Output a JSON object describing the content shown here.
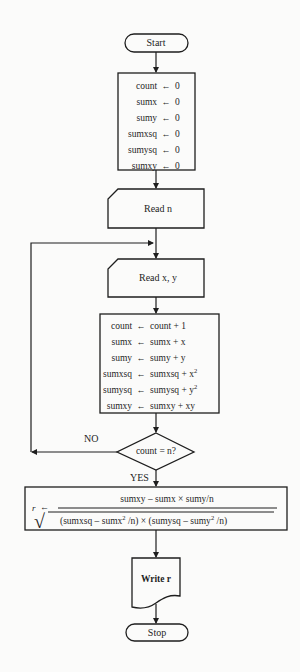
{
  "diagram": {
    "type": "flowchart",
    "nodes": {
      "start": {
        "shape": "terminal",
        "label": "Start"
      },
      "init": {
        "shape": "process",
        "rows": [
          {
            "lhs": "count",
            "op": "←",
            "rhs": "0"
          },
          {
            "lhs": "sumx",
            "op": "←",
            "rhs": "0"
          },
          {
            "lhs": "sumy",
            "op": "←",
            "rhs": "0"
          },
          {
            "lhs": "sumxsq",
            "op": "←",
            "rhs": "0"
          },
          {
            "lhs": "sumysq",
            "op": "←",
            "rhs": "0"
          },
          {
            "lhs": "sumxy",
            "op": "←",
            "rhs": "0"
          }
        ]
      },
      "read_n": {
        "shape": "input-card",
        "label": "Read  n"
      },
      "read_xy": {
        "shape": "input-card",
        "label": "Read  x, y"
      },
      "accumulate": {
        "shape": "process",
        "rows": [
          {
            "lhs": "count",
            "op": "←",
            "rhs": "count + 1",
            "sup": ""
          },
          {
            "lhs": "sumx",
            "op": "←",
            "rhs": "sumx + x",
            "sup": ""
          },
          {
            "lhs": "sumy",
            "op": "←",
            "rhs": "sumy + y",
            "sup": ""
          },
          {
            "lhs": "sumxsq",
            "op": "←",
            "rhs": "sumxsq + x",
            "sup": "2"
          },
          {
            "lhs": "sumysq",
            "op": "←",
            "rhs": "sumysq + y",
            "sup": "2"
          },
          {
            "lhs": "sumxy",
            "op": "←",
            "rhs": "sumxy + xy",
            "sup": ""
          }
        ]
      },
      "decision": {
        "shape": "diamond",
        "label": "count = n?",
        "no_label": "NO",
        "yes_label": "YES"
      },
      "formula": {
        "shape": "process",
        "lhs": "r",
        "op": "←",
        "numerator": "sumxy  – sumx  ×  sumy/n",
        "denominator_parts": {
          "open": "(sumxsq  –  sumx",
          "sup1": "2",
          "mid": " /n)  ×  (sumysq  –  sumy",
          "sup2": "2",
          "close": " /n)"
        },
        "sqrt_symbol": "√"
      },
      "write_r": {
        "shape": "document",
        "label": "Write  r"
      },
      "stop": {
        "shape": "terminal",
        "label": "Stop"
      }
    },
    "edges": [
      {
        "from": "start",
        "to": "init"
      },
      {
        "from": "init",
        "to": "read_n"
      },
      {
        "from": "read_n",
        "to": "read_xy"
      },
      {
        "from": "read_xy",
        "to": "accumulate"
      },
      {
        "from": "accumulate",
        "to": "decision"
      },
      {
        "from": "decision",
        "to": "read_xy",
        "label": "NO"
      },
      {
        "from": "decision",
        "to": "formula",
        "label": "YES"
      },
      {
        "from": "formula",
        "to": "write_r"
      },
      {
        "from": "write_r",
        "to": "stop"
      }
    ],
    "colors": {
      "line": "#1e1e1e",
      "background": "#fbfbfa",
      "fill": "#fbfbfa"
    }
  }
}
